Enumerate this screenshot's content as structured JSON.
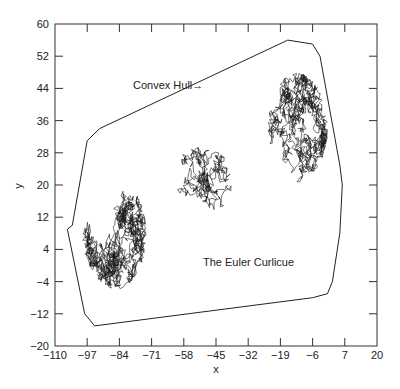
{
  "chart_data": {
    "type": "line",
    "title": "",
    "xlabel": "x",
    "ylabel": "y",
    "xlim": [
      -110,
      20
    ],
    "ylim": [
      -20,
      60
    ],
    "x_ticks": [
      -110,
      -97,
      -84,
      -71,
      -58,
      -45,
      -32,
      -19,
      -6,
      7,
      20
    ],
    "y_ticks": [
      -20,
      -12,
      -4,
      4,
      12,
      20,
      28,
      36,
      44,
      52,
      60
    ],
    "x_tick_labels": [
      "−110",
      "−97",
      "−84",
      "−71",
      "−58",
      "−45",
      "−32",
      "−19",
      "−6",
      "7",
      "20"
    ],
    "y_tick_labels": [
      "−20",
      "−12",
      "−4",
      "4",
      "12",
      "20",
      "28",
      "36",
      "44",
      "52",
      "60"
    ],
    "grid": false,
    "legend": null,
    "annotations": [
      {
        "text": "Convex Hull→",
        "x": -82,
        "y": 46
      },
      {
        "text": "The Euler Curlicue",
        "x": -46,
        "y": 3
      }
    ],
    "series": [
      {
        "name": "Convex Hull",
        "kind": "polygon",
        "points": [
          [
            -16,
            56
          ],
          [
            -6,
            55
          ],
          [
            -3,
            52
          ],
          [
            5,
            25
          ],
          [
            6,
            20
          ],
          [
            5,
            8
          ],
          [
            2,
            -4
          ],
          [
            0,
            -7
          ],
          [
            -6,
            -8
          ],
          [
            -94,
            -15
          ],
          [
            -98,
            -12
          ],
          [
            -105,
            9
          ],
          [
            -103,
            10
          ],
          [
            -97,
            31
          ],
          [
            -92,
            34
          ],
          [
            -16,
            56
          ]
        ]
      },
      {
        "name": "The Euler Curlicue",
        "kind": "random-walk",
        "clusters": [
          {
            "cx": -86,
            "cy": 8,
            "rx": 13,
            "ry": 14,
            "weight": 0.45
          },
          {
            "cx": -12,
            "cy": 34,
            "rx": 12,
            "ry": 14,
            "weight": 0.4
          },
          {
            "cx": -50,
            "cy": 20,
            "rx": 22,
            "ry": 10,
            "weight": 0.15
          }
        ]
      }
    ]
  }
}
